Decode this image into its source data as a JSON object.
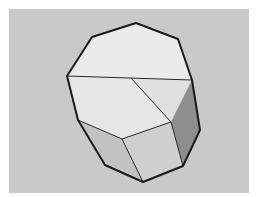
{
  "figure": {
    "background_color": "#c9c9c9",
    "frame_color": "#ffffff",
    "edge_color": "#1a1a1a",
    "faces": {
      "top": "#ebebeb",
      "top_front_left": "#e6e6e6",
      "top_front_right": "#e0e0e0",
      "side_left": "#c2c2c2",
      "side_front": "#cfcfcf",
      "side_right": "#8e8e8e"
    }
  }
}
